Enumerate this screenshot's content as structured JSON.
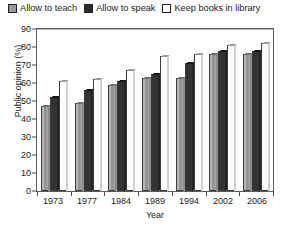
{
  "legend": {
    "position": "top",
    "items": [
      {
        "label": "Allow to teach",
        "swatch": "light-gray-hatched",
        "color": "#a3a3a3"
      },
      {
        "label": "Allow to speak",
        "swatch": "solid-black",
        "color": "#333333"
      },
      {
        "label": "Keep books in library",
        "swatch": "white-outline",
        "color": "#ffffff"
      }
    ]
  },
  "axes": {
    "ylabel": "Public opinion (%)",
    "xlabel": "Year",
    "yticks": [
      "0",
      "10",
      "20",
      "30",
      "40",
      "50",
      "60",
      "70",
      "80",
      "90"
    ]
  },
  "chart_data": {
    "type": "bar",
    "title": "",
    "xlabel": "Year",
    "ylabel": "Public opinion (%)",
    "categories": [
      "1973",
      "1977",
      "1984",
      "1989",
      "1994",
      "2002",
      "2006"
    ],
    "series": [
      {
        "name": "Allow to teach",
        "values": [
          47,
          49,
          59,
          63,
          63,
          76,
          76
        ]
      },
      {
        "name": "Allow to speak",
        "values": [
          52,
          56,
          61,
          65,
          71,
          78,
          78
        ]
      },
      {
        "name": "Keep books in library",
        "values": [
          61,
          62,
          67,
          75,
          76,
          81,
          82
        ]
      }
    ],
    "ylim": [
      0,
      90
    ],
    "ytick_step": 10,
    "grid": false,
    "legend_position": "top"
  }
}
